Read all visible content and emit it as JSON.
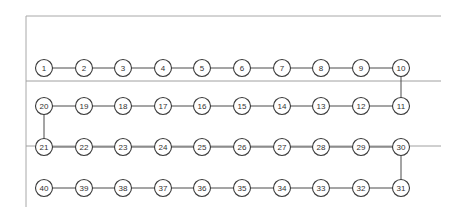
{
  "diagram": {
    "type": "serpentine-node-chain",
    "columns_x": [
      44,
      84,
      123,
      163,
      202,
      242,
      282,
      321,
      361,
      401
    ],
    "rows_y": [
      68,
      106,
      147,
      188
    ],
    "node_radius": 8.5,
    "frame": {
      "left_x": 26,
      "top_y": 16,
      "right_x": 441,
      "bottom_y": 207
    },
    "separators_y": [
      81,
      146
    ],
    "rows": [
      {
        "labels": [
          "1",
          "2",
          "3",
          "4",
          "5",
          "6",
          "7",
          "8",
          "9",
          "10"
        ]
      },
      {
        "labels": [
          "20",
          "19",
          "18",
          "17",
          "16",
          "15",
          "14",
          "13",
          "12",
          "11"
        ]
      },
      {
        "labels": [
          "21",
          "22",
          "23",
          "24",
          "25",
          "26",
          "27",
          "28",
          "29",
          "30"
        ]
      },
      {
        "labels": [
          "40",
          "39",
          "38",
          "37",
          "36",
          "35",
          "34",
          "33",
          "32",
          "31"
        ]
      }
    ],
    "vertical_links": [
      {
        "from": "10",
        "to": "11",
        "column": 9,
        "from_row": 0,
        "to_row": 1
      },
      {
        "from": "20",
        "to": "21",
        "column": 0,
        "from_row": 1,
        "to_row": 2
      },
      {
        "from": "30",
        "to": "31",
        "column": 9,
        "from_row": 2,
        "to_row": 3
      }
    ],
    "colors": {
      "frame": "#a8a8a8",
      "separator": "#a0a0a0",
      "connector": "#4a4a4a",
      "node_stroke": "#3a3a3a",
      "text": "#333333"
    }
  }
}
